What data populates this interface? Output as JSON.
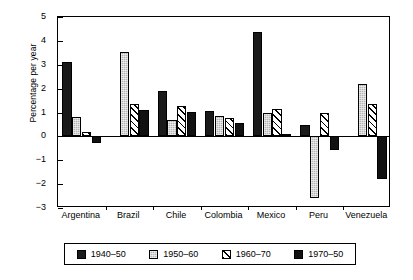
{
  "chart_data": {
    "type": "bar",
    "title": "",
    "xlabel": "",
    "ylabel": "Percentage per year",
    "ylim": [
      -3,
      5
    ],
    "yticks": [
      5,
      4,
      3,
      2,
      1,
      0,
      -1,
      -2,
      -3
    ],
    "ytick_labels": [
      "5",
      "4",
      "3",
      "2",
      "1",
      "0",
      "−1",
      "−2",
      "−3"
    ],
    "grid": false,
    "legend_position": "bottom",
    "categories": [
      "Argentina",
      "Brazil",
      "Chile",
      "Colombia",
      "Mexico",
      "Peru",
      "Venezuela"
    ],
    "series": [
      {
        "name": "1940–50",
        "color": "#1a1a1a",
        "pattern": "solid-black",
        "values": [
          3.1,
          null,
          1.9,
          1.07,
          4.37,
          0.48,
          null
        ]
      },
      {
        "name": "1950–60",
        "color": "#b4b4b4",
        "pattern": "light-gray-dotted",
        "values": [
          0.81,
          3.55,
          0.7,
          0.86,
          1.0,
          -2.6,
          2.19
        ]
      },
      {
        "name": "1960–70",
        "color": "#ffffff",
        "pattern": "diagonal-hatch",
        "values": [
          0.19,
          1.37,
          1.28,
          0.77,
          1.16,
          1.0,
          1.37
        ]
      },
      {
        "name": "1970–50",
        "color": "#111111",
        "pattern": "solid-black",
        "values": [
          -0.29,
          1.1,
          1.01,
          0.57,
          0.08,
          -0.55,
          -1.8
        ]
      }
    ]
  },
  "legend": {
    "entries": [
      {
        "label": "1940–50"
      },
      {
        "label": "1950–60"
      },
      {
        "label": "1960–70"
      },
      {
        "label": "1970–50"
      }
    ]
  }
}
